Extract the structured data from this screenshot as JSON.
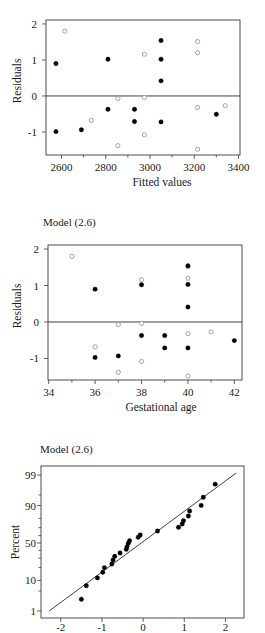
{
  "chart_data": [
    {
      "type": "scatter",
      "title": "",
      "xlabel": "Fitted values",
      "ylabel": "Residuals",
      "xlim": [
        2530,
        3407
      ],
      "ylim": [
        -1.64,
        2.11
      ],
      "yscale": "linear",
      "xticks": [
        2600,
        2800,
        3000,
        3200,
        3400
      ],
      "xtick_labels": [
        "2600",
        "2800",
        "3000",
        "3200",
        "3400"
      ],
      "xminor": [
        2700,
        2900,
        3100,
        3300
      ],
      "yticks": [
        -1,
        0,
        1,
        2
      ],
      "ytick_labels": [
        "-1",
        "0",
        "1",
        "2"
      ],
      "yminor": [],
      "grid": false,
      "legend": null,
      "reference_line": {
        "y": 0
      },
      "series": [
        {
          "marker": "filled-circle",
          "color": "#000000",
          "points": [
            [
              2575,
              0.9
            ],
            [
              2575,
              -0.99
            ],
            [
              2690,
              -0.94
            ],
            [
              2810,
              1.02
            ],
            [
              2810,
              -0.37
            ],
            [
              2930,
              -0.37
            ],
            [
              2930,
              -0.71
            ],
            [
              3050,
              1.54
            ],
            [
              3050,
              1.02
            ],
            [
              3050,
              0.42
            ],
            [
              3050,
              -0.72
            ],
            [
              3300,
              -0.51
            ]
          ]
        },
        {
          "marker": "open-circle",
          "color": "#9a9a9a",
          "points": [
            [
              2615,
              1.8
            ],
            [
              2735,
              -0.68
            ],
            [
              2855,
              -0.07
            ],
            [
              2855,
              -1.38
            ],
            [
              2975,
              1.16
            ],
            [
              2975,
              -0.04
            ],
            [
              2975,
              -1.08
            ],
            [
              3215,
              1.51
            ],
            [
              3215,
              1.2
            ],
            [
              3215,
              -0.32
            ],
            [
              3215,
              -1.48
            ],
            [
              3340,
              -0.27
            ]
          ]
        }
      ]
    },
    {
      "type": "scatter",
      "title": "Model (2.6)",
      "xlabel": "Gestational age",
      "ylabel": "Residuals",
      "xlim": [
        33.97,
        42.33
      ],
      "ylim": [
        -1.59,
        2.11
      ],
      "yscale": "linear",
      "xticks": [
        34,
        36,
        38,
        40,
        42
      ],
      "xtick_labels": [
        "34",
        "36",
        "38",
        "40",
        "42"
      ],
      "xminor": [
        35,
        37,
        39,
        41
      ],
      "yticks": [
        -1,
        0,
        1,
        2
      ],
      "ytick_labels": [
        "-1",
        "0",
        "1",
        "2"
      ],
      "yminor": [],
      "grid": false,
      "legend": null,
      "reference_line": {
        "y": 0
      },
      "series": [
        {
          "marker": "filled-circle",
          "color": "#000000",
          "points": [
            [
              36,
              0.9
            ],
            [
              36,
              -0.97
            ],
            [
              37,
              -0.93
            ],
            [
              38,
              1.02
            ],
            [
              38,
              -0.37
            ],
            [
              39,
              -0.37
            ],
            [
              39,
              -0.71
            ],
            [
              40,
              1.54
            ],
            [
              40,
              1.03
            ],
            [
              40,
              0.41
            ],
            [
              40,
              -0.71
            ],
            [
              42,
              -0.51
            ]
          ]
        },
        {
          "marker": "open-circle",
          "color": "#9a9a9a",
          "points": [
            [
              35,
              1.8
            ],
            [
              36,
              -0.68
            ],
            [
              37,
              -0.07
            ],
            [
              37,
              -1.38
            ],
            [
              38,
              1.16
            ],
            [
              38,
              -0.04
            ],
            [
              38,
              -1.08
            ],
            [
              40,
              1.51
            ],
            [
              40,
              1.2
            ],
            [
              40,
              -0.32
            ],
            [
              40,
              -1.48
            ],
            [
              41,
              -0.27
            ]
          ]
        }
      ]
    },
    {
      "type": "scatter",
      "title": "Model (2.6)",
      "xlabel": "",
      "ylabel": "Percent",
      "xlim": [
        -2.48,
        2.45
      ],
      "ylim": [
        0.51,
        99.58
      ],
      "yscale": "normal_probability",
      "xticks": [
        -2,
        -1,
        0,
        1,
        2
      ],
      "xtick_labels": [
        "-2",
        "-1",
        "0",
        "1",
        "2"
      ],
      "xminor": [],
      "yticks": [
        1,
        10,
        50,
        90,
        99
      ],
      "ytick_labels": [
        "1",
        "10",
        "50",
        "90",
        "99"
      ],
      "yminor": [
        5,
        20,
        30,
        40,
        60,
        70,
        80,
        95
      ],
      "grid": false,
      "legend": null,
      "fit_line": [
        [
          -2.28,
          1.0
        ],
        [
          2.26,
          99.17
        ]
      ],
      "series": [
        {
          "marker": "filled-circle",
          "color": "#000000",
          "points": [
            [
              -1.5,
              2.7
            ],
            [
              -1.38,
              7.2
            ],
            [
              -1.11,
              11.6
            ],
            [
              -0.98,
              15.8
            ],
            [
              -0.94,
              19.9
            ],
            [
              -0.76,
              23.6
            ],
            [
              -0.73,
              28.0
            ],
            [
              -0.69,
              32.4
            ],
            [
              -0.56,
              36.6
            ],
            [
              -0.41,
              41.4
            ],
            [
              -0.39,
              45.0
            ],
            [
              -0.36,
              49.6
            ],
            [
              -0.33,
              53.1
            ],
            [
              -0.12,
              57.7
            ],
            [
              -0.07,
              60.8
            ],
            [
              0.35,
              65.9
            ],
            [
              0.86,
              70.4
            ],
            [
              0.95,
              74.2
            ],
            [
              0.98,
              77.7
            ],
            [
              1.1,
              82.2
            ],
            [
              1.13,
              86.3
            ],
            [
              1.41,
              90.1
            ],
            [
              1.46,
              94.1
            ],
            [
              1.75,
              97.8
            ]
          ]
        }
      ]
    }
  ]
}
